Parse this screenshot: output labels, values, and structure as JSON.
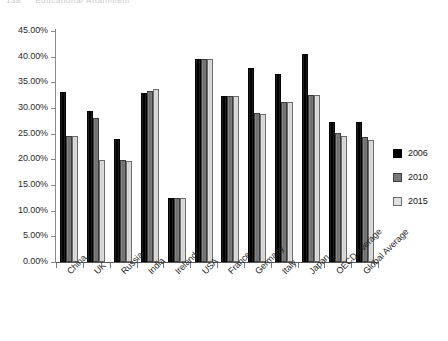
{
  "page_header": {
    "number": "138",
    "text": "Educational Attainment"
  },
  "legend": {
    "position": "right",
    "entries": [
      {
        "label": "2006",
        "color": "#000000"
      },
      {
        "label": "2010",
        "color": "#787878"
      },
      {
        "label": "2015",
        "color": "#e0e0e0"
      }
    ]
  },
  "axis": {
    "y_ticks": [
      "0.00%",
      "5.00%",
      "10.00%",
      "15.00%",
      "20.00%",
      "25.00%",
      "30.00%",
      "35.00%",
      "40.00%",
      "45.00%"
    ]
  },
  "chart_data": {
    "type": "bar",
    "title": "",
    "subtitle": "",
    "xlabel": "",
    "ylabel": "",
    "ylim": [
      0,
      45
    ],
    "ytick_values": [
      0,
      5,
      10,
      15,
      20,
      25,
      30,
      35,
      40,
      45
    ],
    "ytick_labels": [
      "0.00%",
      "5.00%",
      "10.00%",
      "15.00%",
      "20.00%",
      "25.00%",
      "30.00%",
      "35.00%",
      "40.00%",
      "45.00%"
    ],
    "grid": false,
    "legend_position": "right",
    "value_format": "percent",
    "categories": [
      "China",
      "UK",
      "Russia",
      "India",
      "Ireland",
      "USA",
      "France",
      "Germany",
      "Italy",
      "Japan",
      "OECD Average",
      "Global Average"
    ],
    "series": [
      {
        "name": "2006",
        "color": "#000000",
        "values": [
          33.1,
          29.5,
          24.0,
          33.0,
          12.4,
          39.5,
          32.4,
          37.8,
          36.7,
          40.5,
          27.3,
          27.2
        ]
      },
      {
        "name": "2010",
        "color": "#787878",
        "values": [
          24.6,
          28.1,
          19.8,
          33.3,
          12.4,
          39.5,
          32.4,
          29.1,
          31.1,
          32.5,
          25.2,
          24.3
        ]
      },
      {
        "name": "2015",
        "color": "#e0e0e0",
        "values": [
          24.5,
          19.8,
          19.6,
          33.7,
          12.4,
          39.5,
          32.4,
          28.8,
          31.1,
          32.5,
          24.6,
          23.7
        ]
      }
    ]
  }
}
